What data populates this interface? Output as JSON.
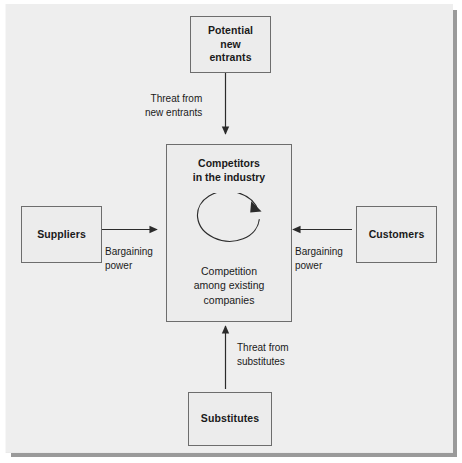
{
  "figure": {
    "kind": "porters-five-forces-diagram",
    "panel_color": "#eeeeee",
    "box_fill": "#ececec",
    "box_border": "#6d6d6d",
    "text_color": "#1a1a1a",
    "shadow_color": "#9a9a9a"
  },
  "nodes": {
    "entrants": {
      "label": "Potential\nnew\nentrants"
    },
    "suppliers": {
      "label": "Suppliers"
    },
    "customers": {
      "label": "Customers"
    },
    "substitutes": {
      "label": "Substitutes"
    },
    "competitors": {
      "title": "Competitors\nin the industry",
      "subtitle": "Competition\namong existing\ncompanies",
      "icon": "circular-rivalry-arrow"
    }
  },
  "edges": {
    "new_entrants": {
      "label": "Threat from\nnew entrants",
      "direction": "down"
    },
    "substitutes": {
      "label": "Threat from\nsubstitutes",
      "direction": "up"
    },
    "suppliers": {
      "label": "Bargaining\npower",
      "direction": "right"
    },
    "customers": {
      "label": "Bargaining\npower",
      "direction": "left"
    }
  }
}
